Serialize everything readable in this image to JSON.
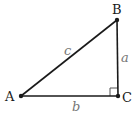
{
  "diagram": {
    "type": "right-triangle",
    "vertices": [
      {
        "id": "A",
        "label": "A",
        "x": 21,
        "y": 96
      },
      {
        "id": "B",
        "label": "B",
        "x": 117,
        "y": 20
      },
      {
        "id": "C",
        "label": "C",
        "x": 118,
        "y": 96
      }
    ],
    "sides": [
      {
        "id": "a",
        "label": "a",
        "from": "B",
        "to": "C"
      },
      {
        "id": "b",
        "label": "b",
        "from": "A",
        "to": "C"
      },
      {
        "id": "c",
        "label": "c",
        "from": "A",
        "to": "B"
      }
    ],
    "right_angle_at": "C",
    "colors": {
      "line": "#1a1a1a",
      "vertex_label": "#1a1a1a",
      "side_label": "#777777",
      "right_angle_mark": "#555555"
    }
  }
}
